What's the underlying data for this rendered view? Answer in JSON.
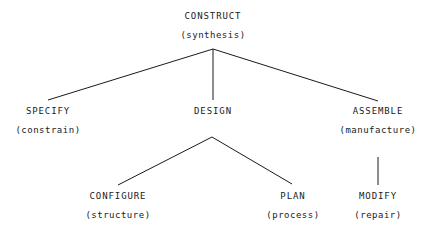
{
  "diagram": {
    "type": "hierarchy-tree",
    "background_color": "#ffffff",
    "line_color": "#1a1a1a",
    "text_color": "#1a1a1a",
    "nodes": [
      {
        "id": "construct",
        "label": "CONSTRUCT",
        "sub": "(synthesis)",
        "level": 0,
        "x": 213,
        "y": 10
      },
      {
        "id": "specify",
        "label": "SPECIFY",
        "sub": "(constrain)",
        "level": 1,
        "x": 48,
        "y": 105
      },
      {
        "id": "design",
        "label": "DESIGN",
        "sub": "",
        "level": 1,
        "x": 213,
        "y": 105
      },
      {
        "id": "assemble",
        "label": "ASSEMBLE",
        "sub": "(manufacture)",
        "level": 1,
        "x": 378,
        "y": 105
      },
      {
        "id": "configure",
        "label": "CONFIGURE",
        "sub": "(structure)",
        "level": 2,
        "x": 118,
        "y": 190
      },
      {
        "id": "plan",
        "label": "PLAN",
        "sub": "(process)",
        "level": 2,
        "x": 293,
        "y": 190
      },
      {
        "id": "modify",
        "label": "MODIFY",
        "sub": "(repair)",
        "level": 2,
        "x": 378,
        "y": 190
      }
    ],
    "edges": [
      {
        "id": "construct-specify",
        "from": "construct",
        "to": "specify",
        "x1": 213,
        "y1": 49,
        "x2": 48,
        "y2": 100
      },
      {
        "id": "construct-design",
        "from": "construct",
        "to": "design",
        "x1": 213,
        "y1": 49,
        "x2": 213,
        "y2": 100
      },
      {
        "id": "construct-assemble",
        "from": "construct",
        "to": "assemble",
        "x1": 213,
        "y1": 49,
        "x2": 378,
        "y2": 101
      },
      {
        "id": "design-configure",
        "from": "design",
        "to": "configure",
        "x1": 212,
        "y1": 137,
        "x2": 118,
        "y2": 185
      },
      {
        "id": "design-plan",
        "from": "design",
        "to": "plan",
        "x1": 212,
        "y1": 137,
        "x2": 292,
        "y2": 184
      },
      {
        "id": "assemble-modify",
        "from": "assemble",
        "to": "modify",
        "x1": 378,
        "y1": 157,
        "x2": 378,
        "y2": 185
      }
    ]
  }
}
